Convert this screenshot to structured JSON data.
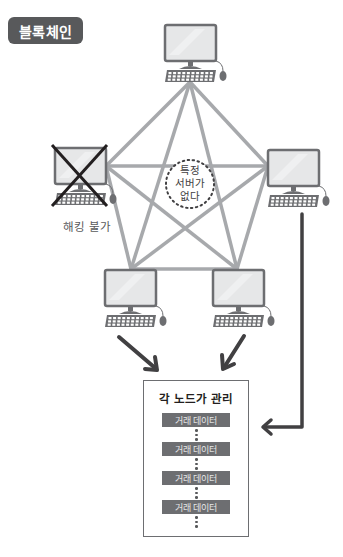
{
  "title": "블록체인",
  "colors": {
    "badge": "#58595b",
    "network_line": "#a7a9ac",
    "arrow": "#414042",
    "monitor_frame": "#6d6e71",
    "screen": "#e6e7e8",
    "tx_block": "#6d6e71"
  },
  "nodes": [
    {
      "id": "top",
      "icon": "computer-icon",
      "hacked": false
    },
    {
      "id": "left",
      "icon": "computer-icon",
      "hacked": true,
      "label": "해킹 불가"
    },
    {
      "id": "right",
      "icon": "computer-icon",
      "hacked": false
    },
    {
      "id": "bottom-left",
      "icon": "computer-icon",
      "hacked": false
    },
    {
      "id": "bottom-right",
      "icon": "computer-icon",
      "hacked": false
    }
  ],
  "center": {
    "lines": [
      "특정",
      "서버가",
      "없다"
    ]
  },
  "ledger": {
    "title": "각 노드가 관리",
    "entries": [
      "거래 데이터",
      "거래 데이터",
      "거래 데이터",
      "거래 데이터"
    ]
  }
}
